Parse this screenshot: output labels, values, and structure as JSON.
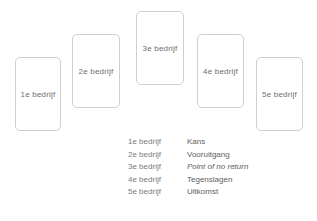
{
  "diagram": {
    "type": "story-arc-cards",
    "cards": [
      {
        "label": "1e bedrijf",
        "x": 15,
        "y": 57,
        "width": 46,
        "height": 74
      },
      {
        "label": "2e bedrijf",
        "x": 72,
        "y": 34,
        "width": 48,
        "height": 74
      },
      {
        "label": "3e bedrijf",
        "x": 136,
        "y": 11,
        "width": 48,
        "height": 74
      },
      {
        "label": "4e bedrijf",
        "x": 197,
        "y": 34,
        "width": 47,
        "height": 74
      },
      {
        "label": "5e bedrijf",
        "x": 256,
        "y": 57,
        "width": 47,
        "height": 74
      }
    ]
  },
  "legend": {
    "rows": [
      {
        "key": "1e bedrijf",
        "value": "Kans",
        "italic": false
      },
      {
        "key": "2e bedrijf",
        "value": "Vooruitgang",
        "italic": false
      },
      {
        "key": "3e bedrijf",
        "value": "Point of no return",
        "italic": true
      },
      {
        "key": "4e bedrijf",
        "value": "Tegenslagen",
        "italic": false
      },
      {
        "key": "5e bedrijf",
        "value": "Uitkomst",
        "italic": false
      }
    ]
  },
  "colors": {
    "card_border": "#cfcfcf",
    "card_background": "#ffffff",
    "card_text": "#6e6e6e",
    "legend_key_text": "#7a7a7a",
    "legend_value_text": "#5e5e5e",
    "page_background": "#ffffff"
  }
}
